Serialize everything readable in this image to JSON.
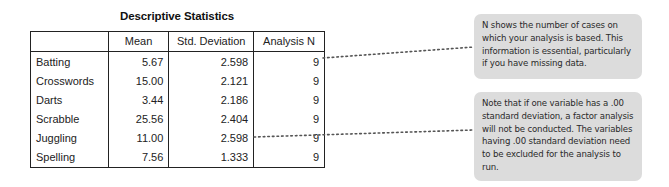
{
  "table": {
    "title": "Descriptive Statistics",
    "columns": [
      "",
      "Mean",
      "Std. Deviation",
      "Analysis N"
    ],
    "rows": [
      {
        "label": "Batting",
        "mean": "5.67",
        "std": "2.598",
        "n": "9"
      },
      {
        "label": "Crosswords",
        "mean": "15.00",
        "std": "2.121",
        "n": "9"
      },
      {
        "label": "Darts",
        "mean": "3.44",
        "std": "2.186",
        "n": "9"
      },
      {
        "label": "Scrabble",
        "mean": "25.56",
        "std": "2.404",
        "n": "9"
      },
      {
        "label": "Juggling",
        "mean": "11.00",
        "std": "2.598",
        "n": "9"
      },
      {
        "label": "Spelling",
        "mean": "7.56",
        "std": "1.333",
        "n": "9"
      }
    ]
  },
  "callouts": [
    {
      "text": "N shows the number of cases on which your analysis is based. This information is essential, particularly if you have missing data.",
      "points_to": "Analysis N (Batting row)"
    },
    {
      "text": "Note that if one variable has a .00 standard deviation, a factor analysis will not be conducted. The variables having .00 standard deviation need to be excluded for the analysis to run.",
      "points_to": "Std. Deviation (Juggling row)"
    }
  ],
  "colors": {
    "callout_bg": "#dcdcdc",
    "border": "#222222",
    "connector": "#555555"
  }
}
